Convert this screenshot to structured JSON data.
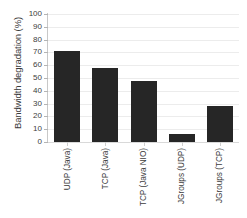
{
  "chart_data": {
    "type": "bar",
    "title": "",
    "xlabel": "",
    "ylabel": "Bandwidth degradation (%)",
    "categories": [
      "UDP (Java)",
      "TCP (Java)",
      "TCP (Java NIO)",
      "JGroups (UDP)",
      "JGroups (TCP)"
    ],
    "values": [
      71,
      58,
      48,
      6,
      28
    ],
    "ylim": [
      0,
      100
    ],
    "yticks": [
      0,
      10,
      20,
      30,
      40,
      50,
      60,
      70,
      80,
      90,
      100
    ],
    "ytick_labels": [
      "0",
      "10",
      "20",
      "30",
      "40",
      "50",
      "60",
      "70",
      "80",
      "90",
      "100"
    ],
    "grid": true,
    "legend": false,
    "bar_color": "#262626",
    "grid_color": "#ececec",
    "axis_color": "#c8c8c8",
    "background": "#ffffff"
  }
}
